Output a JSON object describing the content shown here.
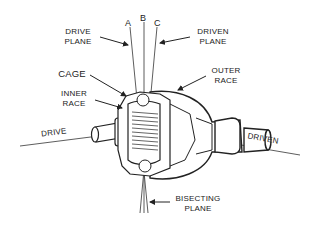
{
  "diagram": {
    "axes": [
      {
        "id": "A",
        "label": "A"
      },
      {
        "id": "B",
        "label": "B"
      },
      {
        "id": "C",
        "label": "C"
      }
    ],
    "labels": {
      "drive_plane_1": "DRIVE",
      "drive_plane_2": "PLANE",
      "driven_plane_1": "DRIVEN",
      "driven_plane_2": "PLANE",
      "cage": "CAGE",
      "inner_race_1": "INNER",
      "inner_race_2": "RACE",
      "outer_race_1": "OUTER",
      "outer_race_2": "RACE",
      "drive": "DRIVE",
      "driven": "DRIVEN",
      "bisecting_plane_1": "BISECTING",
      "bisecting_plane_2": "PLANE"
    },
    "line_color": "#333333"
  }
}
